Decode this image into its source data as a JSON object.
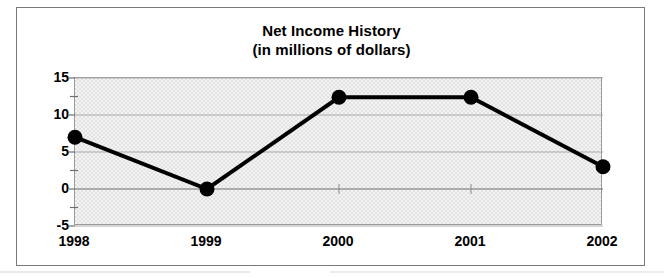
{
  "chart_data": {
    "type": "line",
    "title": "Net Income History",
    "subtitle": "(in millions of dollars)",
    "xlabel": "",
    "ylabel": "",
    "categories": [
      "1998",
      "1999",
      "2000",
      "2001",
      "2002"
    ],
    "values": [
      7,
      0,
      12.4,
      12.4,
      3
    ],
    "series": [
      {
        "name": "Net Income",
        "values": [
          7,
          0,
          12.4,
          12.4,
          3
        ]
      }
    ],
    "ylim": [
      -5,
      15
    ],
    "yticks": [
      15,
      10,
      5,
      0,
      -5
    ],
    "ytick_labels": [
      "15",
      "10",
      "5",
      "0",
      "-5"
    ],
    "y_minor_ticks": [
      12.5,
      7.5,
      2.5,
      -2.5
    ],
    "xtick_labels": [
      "1998",
      "1999",
      "2000",
      "2001",
      "2002"
    ],
    "grid": true,
    "grid_axis": "y",
    "legend": false,
    "legend_position": "none",
    "marker": "filled-circle",
    "marker_color": "#000000",
    "line_color": "#000000",
    "line_width": 4,
    "plot_background": "#ededed",
    "figure_background": "#ffffff",
    "border_color": "#7a7a7a",
    "annotations": []
  },
  "figure": {
    "title": "Net Income History",
    "subtitle": "(in millions of dollars)"
  }
}
